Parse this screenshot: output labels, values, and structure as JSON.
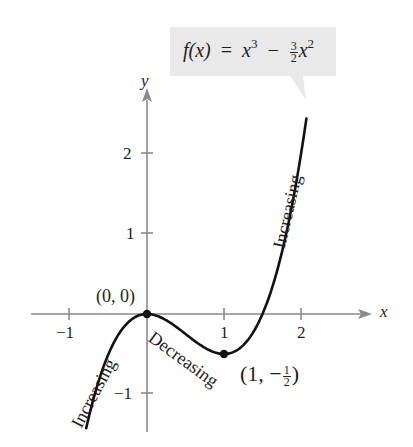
{
  "chart_data": {
    "type": "line",
    "function": "x^3 - 1.5*x^2",
    "formula": {
      "lhs": "f(x)",
      "eq": "=",
      "term1_base": "x",
      "term1_exp": "3",
      "op": "−",
      "coef_num": "3",
      "coef_den": "2",
      "term2_base": "x",
      "term2_exp": "2"
    },
    "xlabel": "x",
    "ylabel": "y",
    "xlim": [
      -1.5,
      2.9
    ],
    "ylim": [
      -1.5,
      3.0
    ],
    "x_range_plotted": [
      -0.79,
      2.07
    ],
    "x_ticks": [
      -1,
      1,
      2
    ],
    "x_tick_labels": [
      "−1",
      "1",
      "2"
    ],
    "y_ticks": [
      2,
      1,
      -1
    ],
    "y_tick_labels": [
      "2",
      "1",
      "−1"
    ],
    "grid": false,
    "points": [
      {
        "x": 0,
        "y": 0,
        "label": "(0, 0)",
        "type": "relative maximum"
      },
      {
        "x": 1,
        "y": -0.5,
        "label_pre": "(1, −",
        "label_num": "1",
        "label_den": "2",
        "label_post": ")",
        "type": "relative minimum"
      }
    ],
    "annotations": [
      {
        "text": "Increasing",
        "interval": "(-∞, 0)"
      },
      {
        "text": "Decreasing",
        "interval": "(0, 1)"
      },
      {
        "text": "Increasing",
        "interval": "(1, ∞)"
      }
    ],
    "colors": {
      "curve": "#111111",
      "axis": "#8a8a8c",
      "label_box": "#e9e9ea",
      "text": "#231f20"
    }
  }
}
